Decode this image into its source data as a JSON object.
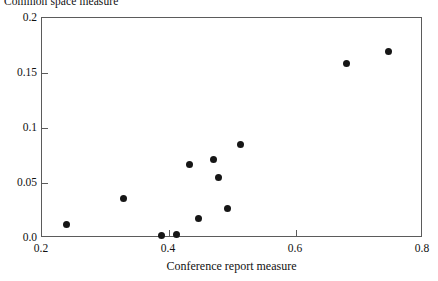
{
  "chart_data": {
    "type": "scatter",
    "title": "Common space measure",
    "xlabel": "Conference report measure",
    "ylabel": "Common space measure",
    "xlim": [
      0.2,
      0.8
    ],
    "ylim": [
      0.0,
      0.2
    ],
    "xticks": [
      "0.2",
      "0.4",
      "0.6",
      "0.8"
    ],
    "xtick_values": [
      0.2,
      0.4,
      0.6,
      0.8
    ],
    "yticks": [
      "0.0",
      "0.05",
      "0.1",
      "0.15",
      "0.2"
    ],
    "ytick_values": [
      0.0,
      0.05,
      0.1,
      0.15,
      0.2
    ],
    "grid": false,
    "legend": null,
    "marker": "filled-circle",
    "marker_color": "#161616",
    "points": [
      {
        "x": 0.238,
        "y": 0.012
      },
      {
        "x": 0.328,
        "y": 0.036
      },
      {
        "x": 0.388,
        "y": 0.002
      },
      {
        "x": 0.412,
        "y": 0.003
      },
      {
        "x": 0.432,
        "y": 0.067
      },
      {
        "x": 0.447,
        "y": 0.018
      },
      {
        "x": 0.47,
        "y": 0.071
      },
      {
        "x": 0.478,
        "y": 0.055
      },
      {
        "x": 0.492,
        "y": 0.027
      },
      {
        "x": 0.512,
        "y": 0.085
      },
      {
        "x": 0.68,
        "y": 0.159
      },
      {
        "x": 0.745,
        "y": 0.17
      }
    ]
  },
  "axis": {
    "frame_color": "#5b5b5b"
  }
}
